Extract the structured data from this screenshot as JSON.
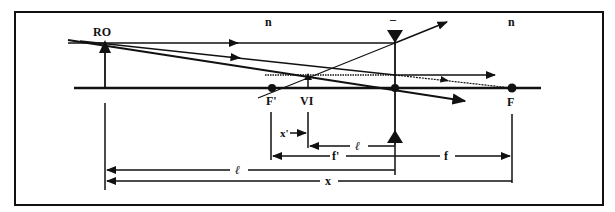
{
  "diagram": {
    "title": "",
    "labels": {
      "real_object": "RO",
      "virtual_image": "VI",
      "object_focal": "F'",
      "image_focal": "F",
      "medium_left": "n",
      "medium_right": "n",
      "lens_sign": "–",
      "dim_x_prime": "x'",
      "dim_l_short": "ℓ",
      "dim_f_prime": "f'",
      "dim_f": "f",
      "dim_l_long": "ℓ",
      "dim_x": "x"
    },
    "elements": [
      "frame",
      "optical-axis",
      "diverging-lens",
      "real-object-arrow",
      "virtual-image-arrow",
      "rays",
      "dimension-lines"
    ],
    "colors": {
      "ink": "#111111",
      "background": "#ffffff"
    }
  }
}
